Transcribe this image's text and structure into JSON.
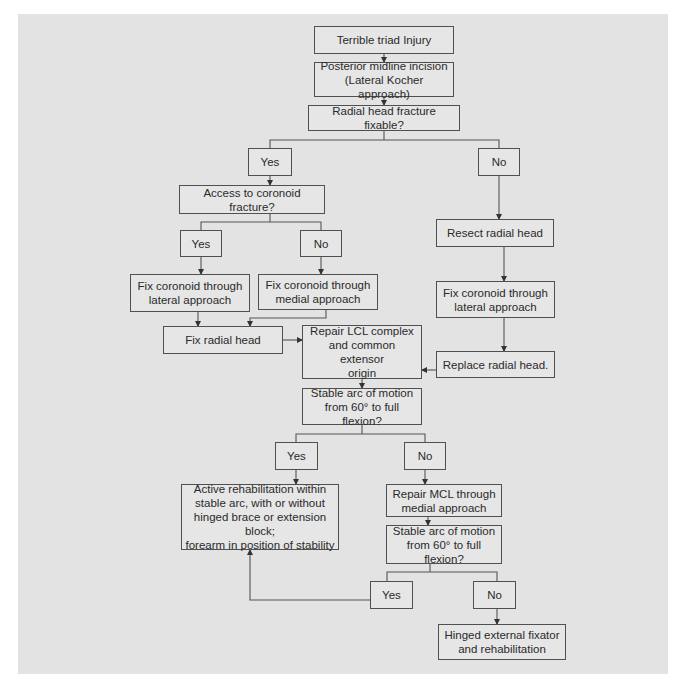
{
  "diagram": {
    "type": "flowchart",
    "background_color": "#e3e3e3",
    "border_color": "#505050",
    "nodes": [
      {
        "id": "n1",
        "label": "Terrible triad Injury",
        "box": [
          314,
          26,
          140,
          28
        ]
      },
      {
        "id": "n2",
        "label": "Posterior midline incision\n(Lateral Kocher approach)",
        "box": [
          314,
          62,
          140,
          35
        ]
      },
      {
        "id": "n3",
        "label": "Radial head fracture fixable?",
        "box": [
          308,
          105,
          152,
          26
        ]
      },
      {
        "id": "n4",
        "label": "Yes",
        "box": [
          248,
          148,
          44,
          28
        ]
      },
      {
        "id": "n5",
        "label": "No",
        "box": [
          478,
          148,
          42,
          28
        ]
      },
      {
        "id": "n6",
        "label": "Access to coronoid fracture?",
        "box": [
          179,
          185,
          146,
          29
        ]
      },
      {
        "id": "n7",
        "label": "Yes",
        "box": [
          180,
          230,
          42,
          27
        ]
      },
      {
        "id": "n8",
        "label": "No",
        "box": [
          300,
          230,
          42,
          27
        ]
      },
      {
        "id": "n9",
        "label": "Fix coronoid through\nlateral approach",
        "box": [
          130,
          274,
          120,
          38
        ]
      },
      {
        "id": "n10",
        "label": "Fix coronoid through\nmedial approach",
        "box": [
          258,
          274,
          120,
          36
        ]
      },
      {
        "id": "n11",
        "label": "Fix radial head",
        "box": [
          163,
          326,
          120,
          28
        ]
      },
      {
        "id": "n12",
        "label": "Repair LCL complex\nand common extensor\norigin",
        "box": [
          302,
          325,
          120,
          54
        ]
      },
      {
        "id": "n13",
        "label": "Resect radial head",
        "box": [
          436,
          219,
          118,
          28
        ]
      },
      {
        "id": "n14",
        "label": "Fix coronoid through\nlateral approach",
        "box": [
          436,
          281,
          119,
          37
        ]
      },
      {
        "id": "n15",
        "label": "Replace radial head.",
        "box": [
          436,
          351,
          119,
          27
        ]
      },
      {
        "id": "n16",
        "label": "Stable arc of motion\nfrom 60° to full flexion?",
        "box": [
          302,
          388,
          120,
          37
        ]
      },
      {
        "id": "n17",
        "label": "Yes",
        "box": [
          275,
          442,
          43,
          28
        ]
      },
      {
        "id": "n18",
        "label": "No",
        "box": [
          404,
          442,
          42,
          28
        ]
      },
      {
        "id": "n19",
        "label": "Active rehabilitation within\nstable arc, with or without\nhinged brace or extension block;\nforearm in position of stability",
        "box": [
          181,
          484,
          158,
          66
        ]
      },
      {
        "id": "n20",
        "label": "Repair MCL through\nmedial approach",
        "box": [
          386,
          484,
          116,
          33
        ]
      },
      {
        "id": "n21",
        "label": "Stable arc of motion\nfrom 60° to full flexion?",
        "box": [
          386,
          525,
          116,
          39
        ]
      },
      {
        "id": "n22",
        "label": "Yes",
        "box": [
          370,
          581,
          43,
          28
        ]
      },
      {
        "id": "n23",
        "label": "No",
        "box": [
          473,
          581,
          43,
          28
        ]
      },
      {
        "id": "n24",
        "label": "Hinged external fixator\nand rehabilitation",
        "box": [
          438,
          624,
          128,
          36
        ]
      }
    ],
    "edges": [
      {
        "from": "n1",
        "to": "n2"
      },
      {
        "from": "n2",
        "to": "n3"
      },
      {
        "from": "n3",
        "to": "n4",
        "style": "branch"
      },
      {
        "from": "n3",
        "to": "n5",
        "style": "branch"
      },
      {
        "from": "n4",
        "to": "n6"
      },
      {
        "from": "n5",
        "to": "n13"
      },
      {
        "from": "n6",
        "to": "n7",
        "style": "branch"
      },
      {
        "from": "n6",
        "to": "n8",
        "style": "branch"
      },
      {
        "from": "n7",
        "to": "n9"
      },
      {
        "from": "n8",
        "to": "n10"
      },
      {
        "from": "n9",
        "to": "n11"
      },
      {
        "from": "n10",
        "to": "n11"
      },
      {
        "from": "n11",
        "to": "n12"
      },
      {
        "from": "n13",
        "to": "n14"
      },
      {
        "from": "n14",
        "to": "n15"
      },
      {
        "from": "n15",
        "to": "n12"
      },
      {
        "from": "n12",
        "to": "n16"
      },
      {
        "from": "n16",
        "to": "n17",
        "style": "branch"
      },
      {
        "from": "n16",
        "to": "n18",
        "style": "branch"
      },
      {
        "from": "n17",
        "to": "n19"
      },
      {
        "from": "n18",
        "to": "n20"
      },
      {
        "from": "n20",
        "to": "n21"
      },
      {
        "from": "n21",
        "to": "n22",
        "style": "branch"
      },
      {
        "from": "n21",
        "to": "n23",
        "style": "branch"
      },
      {
        "from": "n22",
        "to": "n19"
      },
      {
        "from": "n23",
        "to": "n24"
      }
    ]
  }
}
